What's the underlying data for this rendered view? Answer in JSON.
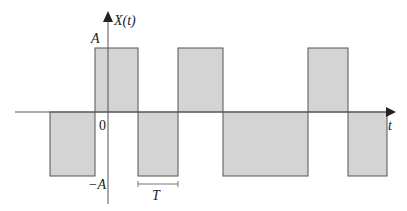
{
  "diagram": {
    "y_axis_label": "X(t)",
    "x_axis_label": "t",
    "top_label": "A",
    "bottom_label": "−A",
    "origin_label": "0",
    "period_label": "T",
    "fill_color": "#d4d4d4",
    "stroke_color": "#555555",
    "segments": [
      {
        "x0": 50,
        "x1": 95,
        "level": "neg"
      },
      {
        "x0": 95,
        "x1": 138,
        "level": "pos"
      },
      {
        "x0": 138,
        "x1": 178,
        "level": "neg"
      },
      {
        "x0": 178,
        "x1": 223,
        "level": "pos"
      },
      {
        "x0": 223,
        "x1": 308,
        "level": "neg"
      },
      {
        "x0": 308,
        "x1": 348,
        "level": "pos"
      },
      {
        "x0": 348,
        "x1": 387,
        "level": "neg"
      }
    ]
  }
}
